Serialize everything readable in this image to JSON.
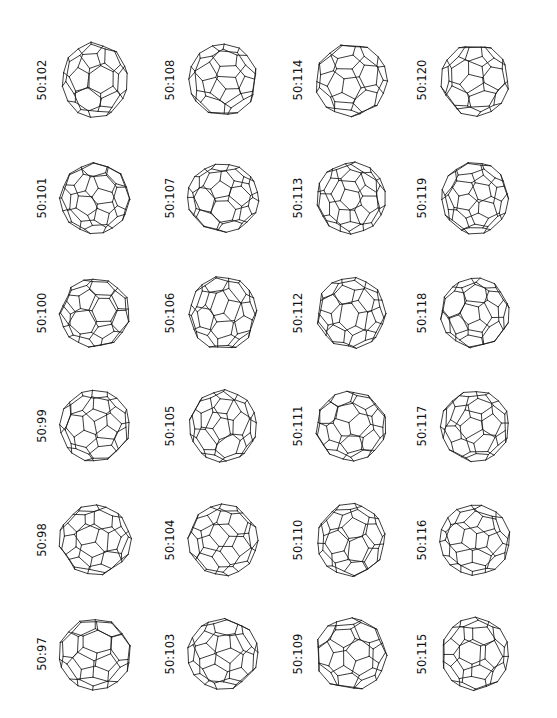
{
  "figure": {
    "kind": "scientific-figure",
    "background_color": "#ffffff",
    "line_color": "#1a1a1a",
    "label_color": "#111111",
    "columns": 4,
    "rows": 6,
    "width": 557,
    "height": 718
  },
  "chart_data": {
    "type": "table",
    "title": "",
    "xlabel": "",
    "ylabel": "",
    "categories": [
      "50:102",
      "50:108",
      "50:114",
      "50:120",
      "50:101",
      "50:107",
      "50:113",
      "50:119",
      "50:100",
      "50:106",
      "50:112",
      "50:118",
      "50:99",
      "50:105",
      "50:111",
      "50:117",
      "50:98",
      "50:104",
      "50:110",
      "50:116",
      "50:97",
      "50:103",
      "50:109",
      "50:115"
    ],
    "values": [
      102,
      108,
      114,
      120,
      101,
      107,
      113,
      119,
      100,
      106,
      112,
      118,
      99,
      105,
      111,
      117,
      98,
      104,
      110,
      116,
      97,
      103,
      109,
      115
    ],
    "legend": [],
    "grid": false
  },
  "cells": [
    {
      "label": "50:102",
      "col": 0,
      "row": 0,
      "seed": 102,
      "shape": "egg",
      "rot": [
        -0.34,
        0.27,
        0.1
      ],
      "sx": 0.95,
      "sy": 1.1
    },
    {
      "label": "50:108",
      "col": 1,
      "row": 0,
      "seed": 108,
      "shape": "round",
      "rot": [
        0.42,
        -0.33,
        -0.22
      ],
      "sx": 1.0,
      "sy": 1.04
    },
    {
      "label": "50:114",
      "col": 2,
      "row": 0,
      "seed": 114,
      "shape": "round",
      "rot": [
        0.18,
        0.62,
        0.05
      ],
      "sx": 1.05,
      "sy": 1.06
    },
    {
      "label": "50:120",
      "col": 3,
      "row": 0,
      "seed": 120,
      "shape": "round",
      "rot": [
        -0.55,
        -0.18,
        0.3
      ],
      "sx": 0.99,
      "sy": 1.05
    },
    {
      "label": "50:101",
      "col": 0,
      "row": 1,
      "seed": 101,
      "shape": "round",
      "rot": [
        0.25,
        0.44,
        -0.14
      ],
      "sx": 1.02,
      "sy": 1.03
    },
    {
      "label": "50:107",
      "col": 1,
      "row": 1,
      "seed": 107,
      "shape": "round",
      "rot": [
        -0.2,
        -0.5,
        0.18
      ],
      "sx": 1.04,
      "sy": 0.99
    },
    {
      "label": "50:113",
      "col": 2,
      "row": 1,
      "seed": 113,
      "shape": "round",
      "rot": [
        0.48,
        0.15,
        -0.26
      ],
      "sx": 1.0,
      "sy": 1.04
    },
    {
      "label": "50:119",
      "col": 3,
      "row": 1,
      "seed": 119,
      "shape": "round",
      "rot": [
        -0.31,
        0.38,
        0.22
      ],
      "sx": 0.97,
      "sy": 1.05
    },
    {
      "label": "50:100",
      "col": 0,
      "row": 2,
      "seed": 100,
      "shape": "smooth",
      "rot": [
        0.1,
        -0.24,
        -0.06
      ],
      "sx": 1.03,
      "sy": 1.0
    },
    {
      "label": "50:106",
      "col": 1,
      "row": 2,
      "seed": 106,
      "shape": "smooth",
      "rot": [
        -0.44,
        0.2,
        0.16
      ],
      "sx": 0.98,
      "sy": 1.07
    },
    {
      "label": "50:112",
      "col": 2,
      "row": 2,
      "seed": 112,
      "shape": "round",
      "rot": [
        0.36,
        -0.41,
        0.09
      ],
      "sx": 1.01,
      "sy": 1.03
    },
    {
      "label": "50:118",
      "col": 3,
      "row": 2,
      "seed": 118,
      "shape": "round",
      "rot": [
        0.58,
        0.26,
        -0.3
      ],
      "sx": 1.0,
      "sy": 1.02
    },
    {
      "label": "50:99",
      "col": 0,
      "row": 3,
      "seed": 99,
      "shape": "round",
      "rot": [
        -0.26,
        -0.36,
        0.12
      ],
      "sx": 1.02,
      "sy": 1.04
    },
    {
      "label": "50:105",
      "col": 1,
      "row": 3,
      "seed": 105,
      "shape": "round",
      "rot": [
        0.3,
        0.52,
        -0.18
      ],
      "sx": 0.98,
      "sy": 1.05
    },
    {
      "label": "50:111",
      "col": 2,
      "row": 3,
      "seed": 111,
      "shape": "round",
      "rot": [
        -0.48,
        0.12,
        0.26
      ],
      "sx": 1.04,
      "sy": 1.01
    },
    {
      "label": "50:117",
      "col": 3,
      "row": 3,
      "seed": 117,
      "shape": "round",
      "rot": [
        0.22,
        -0.58,
        -0.1
      ],
      "sx": 1.0,
      "sy": 1.03
    },
    {
      "label": "50:98",
      "col": 0,
      "row": 4,
      "seed": 98,
      "shape": "smooth",
      "rot": [
        0.4,
        0.18,
        0.24
      ],
      "sx": 1.05,
      "sy": 1.02
    },
    {
      "label": "50:104",
      "col": 1,
      "row": 4,
      "seed": 104,
      "shape": "round",
      "rot": [
        -0.18,
        0.46,
        -0.28
      ],
      "sx": 1.01,
      "sy": 1.04
    },
    {
      "label": "50:110",
      "col": 2,
      "row": 4,
      "seed": 110,
      "shape": "round",
      "rot": [
        0.52,
        -0.22,
        0.14
      ],
      "sx": 0.99,
      "sy": 1.06
    },
    {
      "label": "50:116",
      "col": 3,
      "row": 4,
      "seed": 116,
      "shape": "round",
      "rot": [
        -0.36,
        -0.44,
        -0.16
      ],
      "sx": 1.02,
      "sy": 1.02
    },
    {
      "label": "50:97",
      "col": 0,
      "row": 5,
      "seed": 97,
      "shape": "smooth",
      "rot": [
        0.14,
        0.34,
        0.2
      ],
      "sx": 1.06,
      "sy": 1.04
    },
    {
      "label": "50:103",
      "col": 1,
      "row": 5,
      "seed": 103,
      "shape": "round",
      "rot": [
        -0.5,
        0.24,
        -0.12
      ],
      "sx": 1.03,
      "sy": 1.03
    },
    {
      "label": "50:109",
      "col": 2,
      "row": 5,
      "seed": 109,
      "shape": "round",
      "rot": [
        0.28,
        -0.3,
        0.32
      ],
      "sx": 1.04,
      "sy": 1.05
    },
    {
      "label": "50:115",
      "col": 3,
      "row": 5,
      "seed": 115,
      "shape": "round",
      "rot": [
        -0.22,
        0.56,
        0.08
      ],
      "sx": 0.98,
      "sy": 1.06
    }
  ]
}
